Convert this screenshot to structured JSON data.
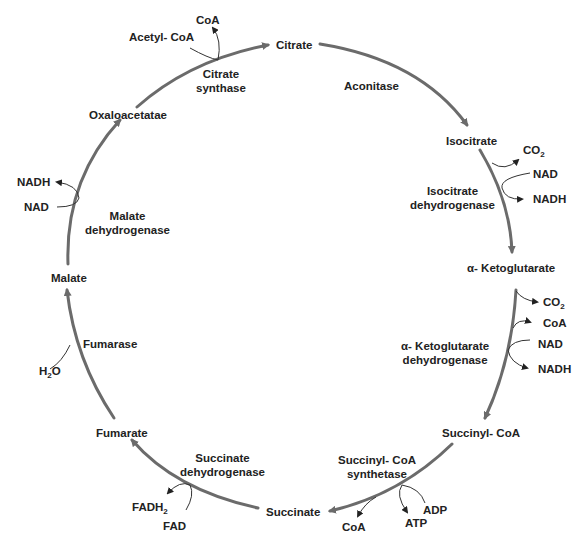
{
  "diagram": {
    "colors": {
      "cycle_arrow": "#6b6b6b",
      "side_arrow": "#333333",
      "text": "#222222",
      "background": "#ffffff"
    },
    "metabolites": {
      "citrate": "Citrate",
      "isocitrate": "Isocitrate",
      "alpha_ketoglutarate": "α- Ketoglutarate",
      "succinyl_coa": "Succinyl- CoA",
      "succinate": "Succinate",
      "fumarate": "Fumarate",
      "malate": "Malate",
      "oxaloacetate": "Oxaloacetatae"
    },
    "enzymes": {
      "citrate_synthase": [
        "Citrate",
        "synthase"
      ],
      "aconitase": [
        "Aconitase"
      ],
      "isocitrate_dehydrogenase": [
        "Isocitrate",
        "dehydrogenase"
      ],
      "akg_dehydrogenase": [
        "α- Ketoglutarate",
        "dehydrogenase"
      ],
      "succinyl_coa_synthetase": [
        "Succinyl- CoA",
        "synthetase"
      ],
      "succinate_dehydrogenase": [
        "Succinate",
        "dehydrogenase"
      ],
      "fumarase": [
        "Fumarase"
      ],
      "malate_dehydrogenase": [
        "Malate",
        "dehydrogenase"
      ]
    },
    "cofactors": {
      "citrate_synthase": {
        "in": "Acetyl- CoA",
        "out": "CoA"
      },
      "isocitrate_dehydrogenase": {
        "out1": "CO",
        "out1_sub": "2",
        "in": "NAD",
        "out2": "NADH"
      },
      "akg_dehydrogenase": {
        "out1": "CO",
        "out1_sub": "2",
        "out2": "CoA",
        "in": "NAD",
        "out3": "NADH"
      },
      "succinyl_coa_synthetase": {
        "out1": "CoA",
        "in": "ADP",
        "out2": "ATP"
      },
      "succinate_dehydrogenase": {
        "out": "FADH",
        "out_sub": "2",
        "in": "FAD"
      },
      "fumarase": {
        "in": "H",
        "in_sub": "2",
        "in_suffix": "O"
      },
      "malate_dehydrogenase": {
        "in": "NAD",
        "out": "NADH"
      }
    }
  }
}
